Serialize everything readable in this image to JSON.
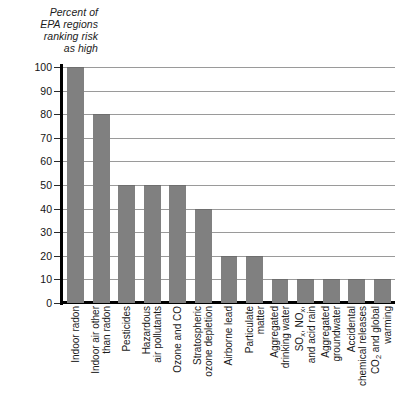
{
  "chart_data": {
    "type": "bar",
    "title": "Percent of EPA regions ranking risk as high",
    "title_lines": [
      "Percent of",
      "EPA regions",
      "ranking risk",
      "as high"
    ],
    "xlabel": "",
    "ylabel": "",
    "ylim": [
      0,
      100
    ],
    "ytick_values": [
      0,
      10,
      20,
      30,
      40,
      50,
      60,
      70,
      80,
      90,
      100
    ],
    "ytick_labels": [
      "0",
      "10",
      "20",
      "30",
      "40",
      "50",
      "60",
      "70",
      "80",
      "90",
      "100"
    ],
    "grid": true,
    "legend": null,
    "bar_color": "#808080",
    "categories": [
      "Indoor radon",
      "Indoor air other than radon",
      "Pesticides",
      "Hazardous air pollutants",
      "Ozone and CO",
      "Stratospheric ozone depletion",
      "Airborne lead",
      "Particulate matter",
      "Aggregated drinking water",
      "SOx, NOx, and acid rain",
      "Aggregated groundwater",
      "Accidental chemical releases",
      "CO2 and global warming"
    ],
    "values": [
      100,
      80,
      50,
      50,
      50,
      40,
      20,
      20,
      10,
      10,
      10,
      10,
      10
    ],
    "category_label_lines": [
      [
        "Indoor radon"
      ],
      [
        "Indoor air other",
        "than radon"
      ],
      [
        "Pesticides"
      ],
      [
        "Hazardous",
        "air pollutants"
      ],
      [
        "Ozone and CO"
      ],
      [
        "Stratospheric",
        "ozone depletion"
      ],
      [
        "Airborne lead"
      ],
      [
        "Particulate",
        "matter"
      ],
      [
        "Aggregated",
        "drinking water"
      ],
      [
        "SO_x, NO_x,",
        "and acid rain"
      ],
      [
        "Aggregated",
        "groundwater"
      ],
      [
        "Accidental",
        "chemical releases"
      ],
      [
        "CO_2 and global",
        "warming"
      ]
    ]
  }
}
